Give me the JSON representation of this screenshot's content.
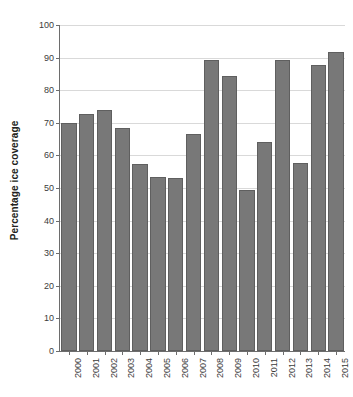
{
  "figure": {
    "cut_off_header_text": "",
    "background_color": "#ffffff"
  },
  "chart_data": {
    "type": "bar",
    "title": "",
    "subtitle": "",
    "xlabel": "",
    "ylabel": "Percentage ice coverage",
    "categories": [
      "2000",
      "2001",
      "2002",
      "2003",
      "2004",
      "2005",
      "2006",
      "2007",
      "2008",
      "2009",
      "2010",
      "2011",
      "2012",
      "2013",
      "2014",
      "2015"
    ],
    "values": [
      70.0,
      72.8,
      74.0,
      68.4,
      57.4,
      53.5,
      53.2,
      66.6,
      89.4,
      84.3,
      49.5,
      64.2,
      89.2,
      57.7,
      87.6,
      91.7
    ],
    "ylim": [
      0,
      100
    ],
    "y_ticks": [
      0,
      10,
      20,
      30,
      40,
      50,
      60,
      70,
      80,
      90,
      100
    ],
    "y_tick_labels": [
      "0",
      "10",
      "20",
      "30",
      "40",
      "50",
      "60",
      "70",
      "80",
      "90",
      "100"
    ],
    "grid": true,
    "grid_axis": "y",
    "legend": false,
    "legend_position": "none",
    "bar_color": "#787878",
    "bar_edge_color": "#5f5f5f",
    "grid_color": "#d9d9d9",
    "axis_color": "#6d6d6d",
    "x_tick_label_rotation": 90
  }
}
